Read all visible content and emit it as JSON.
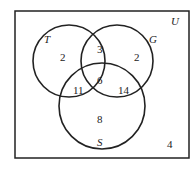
{
  "diagram": {
    "type": "venn",
    "universe_label": "U",
    "sets": [
      {
        "id": "T",
        "label": "T"
      },
      {
        "id": "G",
        "label": "G"
      },
      {
        "id": "S",
        "label": "S"
      }
    ],
    "regions": {
      "T_only": "2",
      "G_only": "2",
      "S_only": "8",
      "T_and_G_only": "3",
      "T_and_S_only": "11",
      "G_and_S_only": "14",
      "T_and_G_and_S": "6",
      "outside": "4"
    }
  }
}
